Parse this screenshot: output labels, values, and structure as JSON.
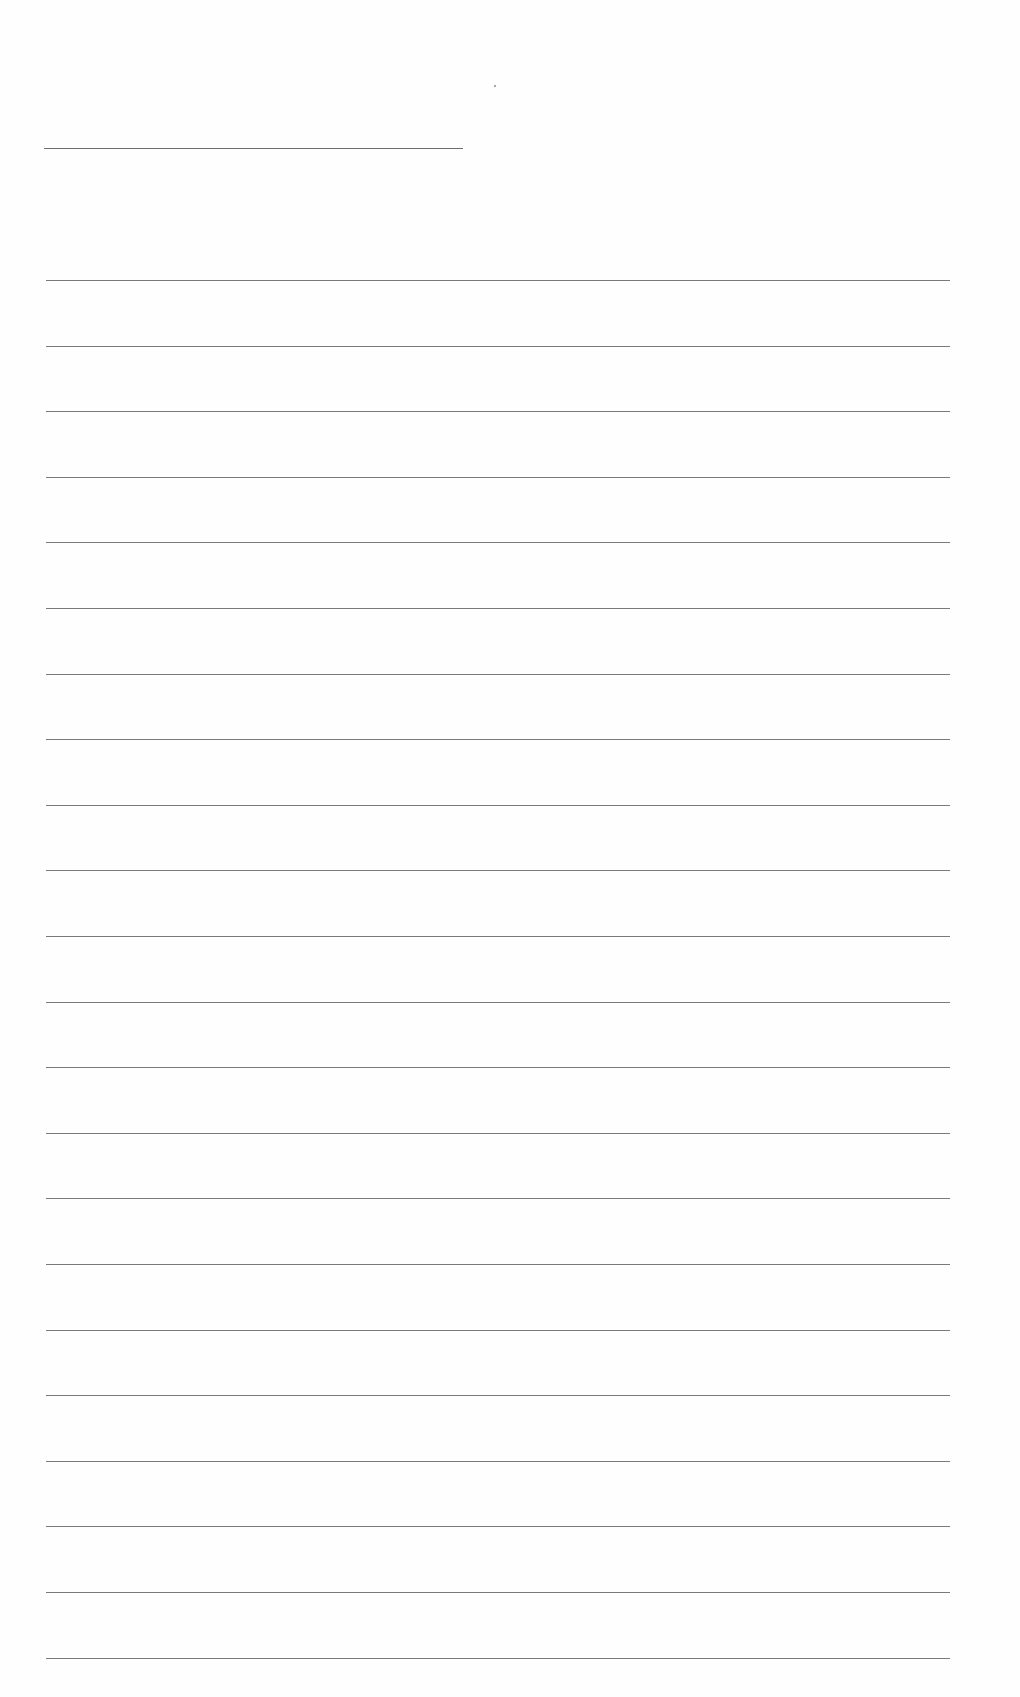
{
  "page": {
    "type": "blank lined paper",
    "title_line": {
      "present": true,
      "text": ""
    },
    "rule_count": 22,
    "rules": [
      "",
      "",
      "",
      "",
      "",
      "",
      "",
      "",
      "",
      "",
      "",
      "",
      "",
      "",
      "",
      "",
      "",
      "",
      "",
      "",
      "",
      ""
    ],
    "colors": {
      "paper": "#fefefe",
      "rule": "#7a7a7a"
    }
  }
}
